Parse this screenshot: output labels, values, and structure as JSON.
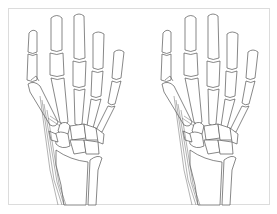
{
  "figure": {
    "panels": [
      {
        "id": "left",
        "label": "",
        "description": "hand-skeleton-dorsal-thumb-fracture-a"
      },
      {
        "id": "right",
        "label": "",
        "description": "hand-skeleton-dorsal-thumb-fracture-b"
      }
    ],
    "colors": {
      "frame_border": "#dcdcdc",
      "line": "#555555",
      "background": "#ffffff"
    }
  }
}
